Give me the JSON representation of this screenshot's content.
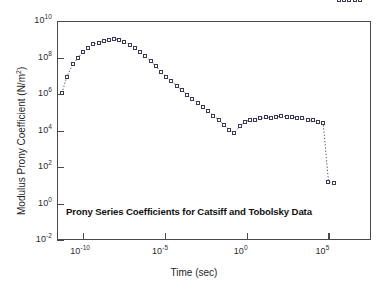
{
  "chart_data": {
    "type": "scatter",
    "title": "Prony Series Coefficients for Catsiff and Tobolsky Data",
    "xlabel": "Time (sec)",
    "ylabel": "Modulus Prony Coefficient (N/m<sup>2</sup>)",
    "ylabel_text": "Modulus Prony Coefficient (N/m2)",
    "xscale": "log",
    "yscale": "log",
    "xlim": [
      -11.6,
      7.6
    ],
    "ylim": [
      -2,
      10
    ],
    "xticks": [
      -10,
      -5,
      0,
      5
    ],
    "xticklabels": [
      "10-10",
      "10-5",
      "100",
      "105"
    ],
    "yticks": [
      -2,
      0,
      2,
      4,
      6,
      8,
      10
    ],
    "yticklabels": [
      "10-2",
      "100",
      "102",
      "104",
      "106",
      "108",
      "1010"
    ],
    "grid": false,
    "legend": "none",
    "marker": "open-square",
    "linestyle": "dotted",
    "series": [
      {
        "name": "Prony coefficients",
        "log_x": [
          -11.3,
          -11.0,
          -10.62,
          -10.3,
          -10.02,
          -9.7,
          -9.4,
          -9.06,
          -8.74,
          -8.44,
          -8.12,
          -7.8,
          -7.48,
          -7.16,
          -6.84,
          -6.52,
          -6.2,
          -5.88,
          -5.56,
          -5.24,
          -4.92,
          -4.6,
          -4.28,
          -3.96,
          -3.64,
          -3.32,
          -3.0,
          -2.68,
          -2.36,
          -2.04,
          -1.72,
          -1.4,
          -1.08,
          -0.76,
          -0.44,
          -0.12,
          0.2,
          0.52,
          0.84,
          1.16,
          1.48,
          1.8,
          2.12,
          2.44,
          2.76,
          3.08,
          3.4,
          3.72,
          4.04,
          4.36,
          4.68,
          5.0,
          5.32,
          5.64,
          5.96,
          6.28,
          6.6,
          6.92
        ],
        "log_y": [
          6.05,
          6.95,
          7.65,
          8.0,
          8.3,
          8.52,
          8.72,
          8.82,
          8.9,
          8.95,
          9.02,
          8.98,
          8.86,
          8.7,
          8.52,
          8.3,
          8.08,
          7.8,
          7.52,
          7.22,
          6.95,
          6.7,
          6.45,
          6.2,
          5.96,
          5.72,
          5.5,
          5.28,
          5.05,
          4.82,
          4.58,
          4.32,
          4.05,
          3.86,
          4.22,
          4.46,
          4.6,
          4.55,
          4.66,
          4.72,
          4.7,
          4.75,
          4.78,
          4.76,
          4.74,
          4.7,
          4.66,
          4.6,
          4.55,
          4.48,
          4.4,
          1.2,
          1.12
        ],
        "x_units": "log10(seconds)",
        "y_units": "log10(N/m^2)"
      }
    ]
  },
  "axes": {
    "x": {
      "label": "Time (sec)",
      "ticks": [
        {
          "base": "10",
          "exp": "-10"
        },
        {
          "base": "10",
          "exp": "-5"
        },
        {
          "base": "10",
          "exp": "0"
        },
        {
          "base": "10",
          "exp": "5"
        }
      ]
    },
    "y": {
      "label_main": "Modulus Prony Coefficient (N/m",
      "label_exp": "2",
      "label_close": ")",
      "ticks": [
        {
          "base": "10",
          "exp": "10"
        },
        {
          "base": "10",
          "exp": "8"
        },
        {
          "base": "10",
          "exp": "6"
        },
        {
          "base": "10",
          "exp": "4"
        },
        {
          "base": "10",
          "exp": "2"
        },
        {
          "base": "10",
          "exp": "0"
        },
        {
          "base": "10",
          "exp": "-2"
        }
      ]
    }
  },
  "annotation": {
    "title_in_plot": "Prony Series Coefficients for Catsiff and Tobolsky Data"
  },
  "colors": {
    "axis": "#4a4a4a",
    "marker_edge": "#3a3a52",
    "line": "#4a4a66",
    "text": "#1a1a1a",
    "background": "#ffffff"
  }
}
